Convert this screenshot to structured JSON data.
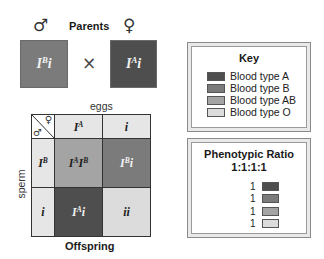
{
  "parents": {
    "title": "Parents",
    "male_symbol": "♂",
    "female_symbol": "♀",
    "cross_symbol": "×",
    "father": {
      "base1": "I",
      "sup1": "B",
      "base2": "i",
      "color": "#7b7b7b"
    },
    "mother": {
      "base1": "I",
      "sup1": "A",
      "base2": "i",
      "color": "#4e4e4e"
    }
  },
  "punnett": {
    "top_label": "eggs",
    "side_label": "sperm",
    "bottom_label": "Offspring",
    "corner": {
      "male_symbol": "♂",
      "female_symbol": "♀"
    },
    "columns": [
      {
        "base1": "I",
        "sup1": "A",
        "base2": ""
      },
      {
        "base1": "",
        "sup1": "",
        "base2": "i"
      }
    ],
    "rows": [
      {
        "base1": "I",
        "sup1": "B",
        "base2": ""
      },
      {
        "base1": "",
        "sup1": "",
        "base2": "i"
      }
    ],
    "header_color": "#e6e6e6",
    "cells": [
      [
        {
          "base1": "I",
          "sup1": "A",
          "base2": "I",
          "sup2": "B",
          "tail": "",
          "color": "#a4a4a4",
          "text": "dark"
        },
        {
          "base1": "I",
          "sup1": "B",
          "base2": "",
          "sup2": "",
          "tail": "i",
          "color": "#7b7b7b",
          "text": "light"
        }
      ],
      [
        {
          "base1": "I",
          "sup1": "A",
          "base2": "",
          "sup2": "",
          "tail": "i",
          "color": "#4e4e4e",
          "text": "light"
        },
        {
          "base1": "",
          "sup1": "",
          "base2": "",
          "sup2": "",
          "tail": "ii",
          "color": "#dcdcdc",
          "text": "dark"
        }
      ]
    ]
  },
  "key": {
    "title": "Key",
    "items": [
      {
        "label": "Blood type A",
        "color": "#4e4e4e"
      },
      {
        "label": "Blood type B",
        "color": "#7b7b7b"
      },
      {
        "label": "Blood type AB",
        "color": "#a4a4a4"
      },
      {
        "label": "Blood type O",
        "color": "#dcdcdc"
      }
    ]
  },
  "ratio": {
    "title": "Phenotypic Ratio",
    "value": "1:1:1:1",
    "items": [
      {
        "count": "1",
        "color": "#4e4e4e"
      },
      {
        "count": "1",
        "color": "#7b7b7b"
      },
      {
        "count": "1",
        "color": "#a4a4a4"
      },
      {
        "count": "1",
        "color": "#dcdcdc"
      }
    ]
  }
}
